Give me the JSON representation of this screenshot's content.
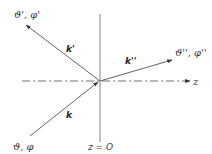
{
  "diagram": {
    "type": "wave-vector scattering diagram",
    "axis": {
      "label": "z",
      "interface_label": "z = O"
    },
    "vectors": {
      "incident": {
        "label": "k",
        "angles_label": "ϑ, φ"
      },
      "reflected": {
        "label": "k'",
        "angles_label": "ϑ', φ'"
      },
      "transmitted": {
        "label": "k''",
        "angles_label": "ϑ'', φ''"
      }
    },
    "colors": {
      "line": "#555555",
      "text": "#333333",
      "background": "#ffffff"
    }
  }
}
